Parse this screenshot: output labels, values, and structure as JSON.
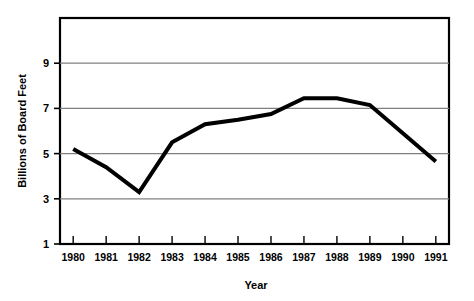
{
  "chart_data": {
    "type": "line",
    "title": "",
    "xlabel": "Year",
    "ylabel": "Billions of Board Feet",
    "categories": [
      "1980",
      "1981",
      "1982",
      "1983",
      "1984",
      "1985",
      "1986",
      "1987",
      "1988",
      "1989",
      "1990",
      "1991"
    ],
    "x": [
      1980,
      1981,
      1982,
      1983,
      1984,
      1985,
      1986,
      1987,
      1988,
      1989,
      1990,
      1991
    ],
    "values": [
      5.2,
      4.4,
      3.3,
      5.5,
      6.3,
      6.5,
      6.75,
      7.45,
      7.45,
      7.15,
      5.9,
      4.65
    ],
    "ylim": [
      1,
      11
    ],
    "xlim": [
      1979.6,
      1991.4
    ],
    "yticks": [
      1,
      3,
      5,
      7,
      9
    ],
    "ytick_labels": [
      "1",
      "3",
      "5",
      "7",
      "9"
    ],
    "xtick_labels": [
      "1980",
      "1981",
      "1982",
      "1983",
      "1984",
      "1985",
      "1986",
      "1987",
      "1988",
      "1989",
      "1990",
      "1991"
    ],
    "grid": "horizontal",
    "legend": "none",
    "line_color": "#000000",
    "line_width": 4,
    "grid_color": "#808080",
    "axis_color": "#000000",
    "background_color": "#ffffff"
  },
  "axes": {
    "y_title": "Billions of Board Feet",
    "x_title": "Year"
  }
}
